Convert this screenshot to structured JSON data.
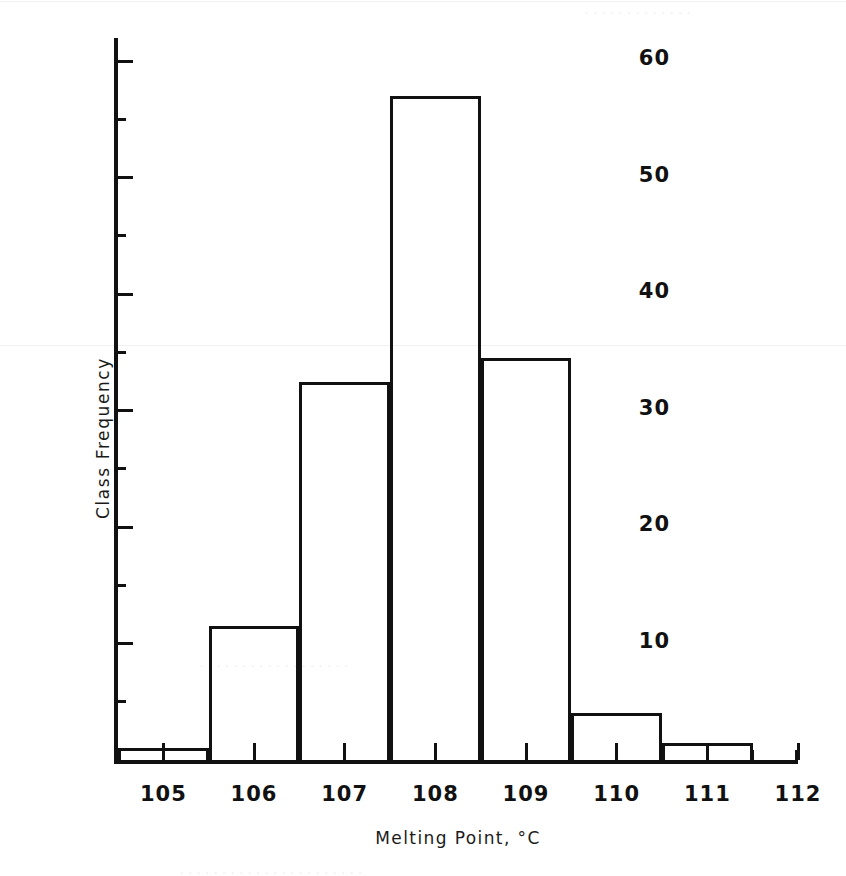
{
  "chart_data": {
    "type": "bar",
    "title": "",
    "xlabel": "Melting Point, °C",
    "ylabel": "Class Frequency",
    "xlim": [
      104.5,
      112.0
    ],
    "ylim": [
      0,
      62
    ],
    "grid": false,
    "legend": "none",
    "bin_width": 1,
    "x_tick_labels": [
      "105",
      "106",
      "107",
      "108",
      "109",
      "110",
      "111",
      "112"
    ],
    "x_major_ticks": [
      105,
      106,
      107,
      108,
      109,
      110,
      111,
      112
    ],
    "x_minor_ticks": [
      104.5,
      105.5,
      106.5,
      107.5,
      108.5,
      109.5,
      110.5,
      111.5
    ],
    "y_tick_labels": [
      "10",
      "20",
      "30",
      "40",
      "50",
      "60"
    ],
    "y_major_ticks": [
      10,
      20,
      30,
      40,
      50,
      60
    ],
    "y_minor_ticks": [
      5,
      15,
      25,
      35,
      45,
      55
    ],
    "bins": [
      {
        "label": "105",
        "bin_start": 104.5,
        "bin_end": 105.5,
        "center": 105,
        "value": 1
      },
      {
        "label": "106",
        "bin_start": 105.5,
        "bin_end": 106.5,
        "center": 106,
        "value": 11.5
      },
      {
        "label": "107",
        "bin_start": 106.5,
        "bin_end": 107.5,
        "center": 107,
        "value": 32.5
      },
      {
        "label": "108",
        "bin_start": 107.5,
        "bin_end": 108.5,
        "center": 108,
        "value": 57
      },
      {
        "label": "109",
        "bin_start": 108.5,
        "bin_end": 109.5,
        "center": 109,
        "value": 34.5
      },
      {
        "label": "110",
        "bin_start": 109.5,
        "bin_end": 110.5,
        "center": 110,
        "value": 4
      },
      {
        "label": "111",
        "bin_start": 110.5,
        "bin_end": 111.5,
        "center": 111,
        "value": 1.5
      }
    ],
    "categories": [
      "105",
      "106",
      "107",
      "108",
      "109",
      "110",
      "111"
    ],
    "values": [
      1,
      11.5,
      32.5,
      57,
      34.5,
      4,
      1.5
    ],
    "colors": {
      "ink": "#111111",
      "background": "#ffffff",
      "bar_fill": "transparent",
      "bar_stroke": "#111111"
    }
  }
}
